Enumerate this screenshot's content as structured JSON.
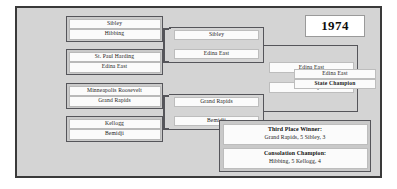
{
  "title": {
    "year": "1974"
  },
  "rounds": {
    "first": [
      {
        "name": "quarterfinal-1",
        "teams": [
          "Sibley",
          "Hibbing"
        ]
      },
      {
        "name": "quarterfinal-2",
        "teams": [
          "St. Paul Harding",
          "Edina East"
        ]
      },
      {
        "name": "quarterfinal-3",
        "teams": [
          "Minneapolis Roosevelt",
          "Grand Rapids"
        ]
      },
      {
        "name": "quarterfinal-4",
        "teams": [
          "Kellogg",
          "Bemidji"
        ]
      }
    ],
    "second": [
      {
        "name": "semifinal-entry-1",
        "team": "Sibley"
      },
      {
        "name": "semifinal-entry-2",
        "team": "Edina East"
      },
      {
        "name": "semifinal-entry-3",
        "team": "Grand Rapids"
      },
      {
        "name": "semifinal-entry-4",
        "team": "Bemidji"
      }
    ],
    "semifinal": [
      {
        "name": "final-entry-1",
        "team": "Edina East"
      },
      {
        "name": "final-entry-2",
        "team": "Bemidji"
      }
    ],
    "final": {
      "team": "Edina East",
      "label": "State Champion"
    }
  },
  "awards": [
    {
      "title": "Third Place Winner:",
      "score": "Grand Rapids, 5  Sibley, 3"
    },
    {
      "title": "Consolation Champion:",
      "score": "Hibbing, 5  Kellogg, 4"
    }
  ],
  "colors": {
    "frame_bg": "#d4d4d4",
    "frame_border": "#3a3a3a",
    "box_border": "#55555a",
    "plate_bg": "#fbfbfb",
    "text": "#1a1a1a"
  }
}
